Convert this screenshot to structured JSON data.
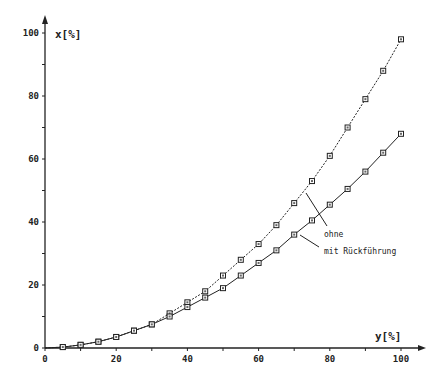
{
  "chart_data": {
    "type": "line",
    "title": "",
    "xlabel": "y[%]",
    "ylabel": "x[%]",
    "xlim": [
      0,
      100
    ],
    "ylim": [
      0,
      100
    ],
    "grid": false,
    "x_ticks": [
      "0",
      "20",
      "40",
      "60",
      "80",
      "100"
    ],
    "y_ticks": [
      "0",
      "20",
      "40",
      "60",
      "80",
      "100"
    ],
    "x": [
      0,
      5,
      10,
      15,
      20,
      25,
      30,
      35,
      40,
      45,
      50,
      55,
      60,
      65,
      70,
      75,
      80,
      85,
      90,
      95,
      100
    ],
    "series": [
      {
        "name": "ohne",
        "style": "dotted",
        "values": [
          0,
          0.3,
          1,
          2,
          3.5,
          5.5,
          7.5,
          11,
          14.5,
          18,
          23,
          28,
          33,
          39,
          46,
          53,
          61,
          70,
          79,
          88,
          98
        ]
      },
      {
        "name": "mit Rückführung",
        "style": "solid",
        "values": [
          0,
          0.3,
          1,
          2,
          3.5,
          5.5,
          7.5,
          10,
          13,
          16,
          19,
          23,
          27,
          31,
          36,
          40.5,
          45.5,
          50.5,
          56,
          62,
          68
        ]
      }
    ],
    "annotations": [
      {
        "text": "ohne",
        "target_series": "ohne"
      },
      {
        "text": "mit  Rückführung",
        "target_series": "mit Rückführung"
      }
    ]
  }
}
